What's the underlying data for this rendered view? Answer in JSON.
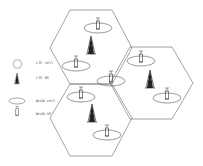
{
  "legend": {
    "items": [
      {
        "icon": "hexagon-icon",
        "label": "LTE cell"
      },
      {
        "icon": "tower-icon",
        "label": "LTE BS"
      },
      {
        "icon": "ellipse-icon",
        "label": "WLAN cell"
      },
      {
        "icon": "access-point-icon",
        "label": "WLAN AP"
      }
    ]
  },
  "colors": {
    "stroke": "#555555",
    "tower": "#222222",
    "background": "#ffffff"
  },
  "cells": [
    {
      "name": "lte-cell-top",
      "center": [
        92,
        52
      ]
    },
    {
      "name": "lte-cell-right",
      "center": [
        148,
        84
      ]
    },
    {
      "name": "lte-cell-bottom",
      "center": [
        92,
        120
      ]
    }
  ]
}
